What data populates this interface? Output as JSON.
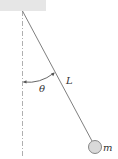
{
  "diagram": {
    "type": "simple-pendulum",
    "labels": {
      "angle": "θ",
      "length": "L",
      "mass": "m"
    },
    "colors": {
      "ceiling": "#e6e6e6",
      "string": "#707070",
      "vertical_reference": "#9a9a9a",
      "bob_fill": "#d9d9d9",
      "bob_stroke": "#7a7a7a",
      "arc": "#555555",
      "text": "#333333"
    }
  }
}
